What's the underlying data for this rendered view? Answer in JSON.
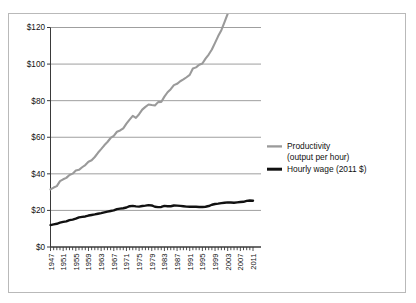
{
  "chart_data": {
    "type": "line",
    "title": "",
    "subtitle": "",
    "xlabel": "",
    "ylabel": "",
    "xlim": [
      1947,
      2011
    ],
    "ylim": [
      0,
      120
    ],
    "ytick_labels": [
      "$0",
      "$20",
      "$40",
      "$60",
      "$80",
      "$100",
      "$120"
    ],
    "ytick_values": [
      0,
      20,
      40,
      60,
      80,
      100,
      120
    ],
    "xtick_labels": [
      "1947",
      "1951",
      "1955",
      "1959",
      "1963",
      "1967",
      "1971",
      "1975",
      "1979",
      "1983",
      "1987",
      "1991",
      "1995",
      "1999",
      "2003",
      "2007",
      "2011"
    ],
    "xtick_values": [
      1947,
      1951,
      1955,
      1959,
      1963,
      1967,
      1971,
      1975,
      1979,
      1983,
      1987,
      1991,
      1995,
      1999,
      2003,
      2007,
      2011
    ],
    "minor_tick_interval": 1,
    "grid": "horizontal",
    "legend_position": "right",
    "x": [
      1947,
      1948,
      1949,
      1950,
      1951,
      1952,
      1953,
      1954,
      1955,
      1956,
      1957,
      1958,
      1959,
      1960,
      1961,
      1962,
      1963,
      1964,
      1965,
      1966,
      1967,
      1968,
      1969,
      1970,
      1971,
      1972,
      1973,
      1974,
      1975,
      1976,
      1977,
      1978,
      1979,
      1980,
      1981,
      1982,
      1983,
      1984,
      1985,
      1986,
      1987,
      1988,
      1989,
      1990,
      1991,
      1992,
      1993,
      1994,
      1995,
      1996,
      1997,
      1998,
      1999,
      2000,
      2001,
      2002,
      2003,
      2004,
      2005,
      2006,
      2007,
      2008,
      2009,
      2010,
      2011
    ],
    "series": [
      {
        "name": "Productivity (output per hour)",
        "color": "#9a9a9a",
        "width": 2.1,
        "values": [
          31.5,
          32.5,
          33.3,
          36.0,
          37.0,
          37.8,
          39.4,
          40.1,
          41.8,
          42.2,
          43.6,
          44.8,
          46.6,
          47.4,
          49.2,
          51.5,
          53.5,
          55.6,
          57.4,
          59.6,
          60.8,
          63.0,
          63.7,
          64.9,
          67.4,
          69.6,
          71.7,
          70.6,
          72.6,
          75.1,
          76.6,
          77.9,
          77.6,
          77.4,
          79.2,
          79.3,
          82.2,
          84.6,
          86.3,
          88.5,
          89.2,
          90.6,
          91.6,
          92.8,
          94.1,
          97.6,
          98.2,
          99.6,
          100.3,
          103.0,
          105.2,
          108.0,
          111.6,
          115.3,
          118.5,
          123.0,
          127.5,
          131.0,
          133.4,
          134.2,
          136.0,
          137.2,
          142.5,
          148.0,
          148.5
        ],
        "endpoint_label_value": 108.5
      },
      {
        "name": "Hourly wage (2011 $)",
        "color": "#111111",
        "width": 2.4,
        "values": [
          12.0,
          12.4,
          12.7,
          13.3,
          13.7,
          14.0,
          14.7,
          15.0,
          15.5,
          16.2,
          16.5,
          16.7,
          17.2,
          17.5,
          17.8,
          18.2,
          18.5,
          18.9,
          19.3,
          19.7,
          20.0,
          20.7,
          21.0,
          21.2,
          21.6,
          22.3,
          22.5,
          22.2,
          22.1,
          22.4,
          22.6,
          22.9,
          22.7,
          22.0,
          21.8,
          21.9,
          22.5,
          22.3,
          22.3,
          22.7,
          22.6,
          22.5,
          22.3,
          22.1,
          22.0,
          22.1,
          22.0,
          21.9,
          21.9,
          22.0,
          22.4,
          23.1,
          23.5,
          23.7,
          24.0,
          24.2,
          24.4,
          24.3,
          24.2,
          24.4,
          24.6,
          24.7,
          25.2,
          25.4,
          25.3
        ]
      }
    ],
    "legend": [
      {
        "label": "Productivity",
        "label_line2": "(output per hour)",
        "color": "#9a9a9a"
      },
      {
        "label": "Hourly wage (2011 $)",
        "label_line2": "",
        "color": "#111111"
      }
    ]
  }
}
